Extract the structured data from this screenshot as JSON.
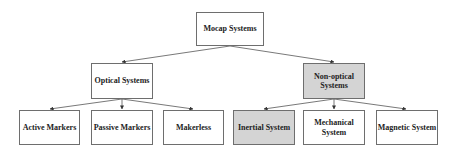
{
  "diagram": {
    "type": "tree",
    "colors": {
      "box_border": "#6e6e6e",
      "highlight_fill": "#d4d4d4",
      "box_fill": "#ffffff",
      "edge": "#444444"
    },
    "root": {
      "id": "mocap",
      "label": "Mocap Systems"
    },
    "level1": [
      {
        "id": "optical",
        "label": "Optical Systems",
        "highlighted": false
      },
      {
        "id": "nonoptical",
        "label": "Non-optical Systems",
        "highlighted": true
      }
    ],
    "level2": [
      {
        "id": "active",
        "parent": "optical",
        "label": "Active Markers",
        "highlighted": false
      },
      {
        "id": "passive",
        "parent": "optical",
        "label": "Passive Markers",
        "highlighted": false
      },
      {
        "id": "makerless",
        "parent": "optical",
        "label": "Makerless",
        "highlighted": false
      },
      {
        "id": "inertial",
        "parent": "nonoptical",
        "label": "Inertial System",
        "highlighted": true
      },
      {
        "id": "mechanical",
        "parent": "nonoptical",
        "label": "Mechanical System",
        "highlighted": false
      },
      {
        "id": "magnetic",
        "parent": "nonoptical",
        "label": "Magnetic System",
        "highlighted": false
      }
    ]
  }
}
